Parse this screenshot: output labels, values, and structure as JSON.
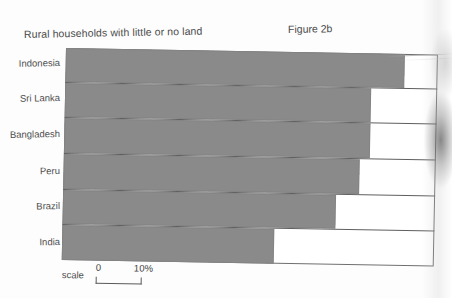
{
  "figure": {
    "title": "Rural households with little or no land",
    "label": "Figure 2b"
  },
  "scale": {
    "word": "scale",
    "min_label": "0",
    "max_label": "10%"
  },
  "chart_data": {
    "type": "bar",
    "orientation": "horizontal",
    "title": "Rural households with little or no land",
    "subtitle": "Figure 2b",
    "xlabel": "",
    "ylabel": "",
    "categories": [
      "Indonesia",
      "Sri Lanka",
      "Bangladesh",
      "Peru",
      "Brazil",
      "India"
    ],
    "values": [
      72,
      65,
      65,
      63,
      58,
      45
    ],
    "unit": "%",
    "xlim": [
      0,
      80
    ],
    "scale_reference": {
      "from": 0,
      "to": 10,
      "unit": "%"
    },
    "grid": false,
    "legend": null,
    "bar_color": "#8a8a8a",
    "frame_color": "#6e6e6e",
    "background": "#ffffff",
    "note": "Bar lengths read against a 0-10% scale bar; values estimated from pixel extents."
  }
}
